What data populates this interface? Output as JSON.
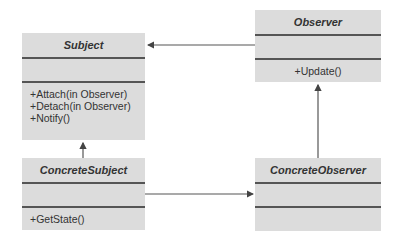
{
  "diagram": {
    "type": "UML class diagram (Observer pattern)",
    "classes": [
      {
        "id": "subject",
        "name": "Subject",
        "attributes": [],
        "operations": [
          "+Attach(in Observer)",
          "+Detach(in Observer)",
          "+Notify()"
        ]
      },
      {
        "id": "observer",
        "name": "Observer",
        "attributes": [],
        "operations": [
          "+Update()"
        ]
      },
      {
        "id": "concrete_subject",
        "name": "ConcreteSubject",
        "attributes": [],
        "operations": [
          "+GetState()"
        ]
      },
      {
        "id": "concrete_observer",
        "name": "ConcreteObserver",
        "attributes": [],
        "operations": []
      }
    ],
    "relations": [
      {
        "from": "Observer",
        "to": "Subject",
        "kind": "association arrow"
      },
      {
        "from": "ConcreteSubject",
        "to": "Subject",
        "kind": "arrow"
      },
      {
        "from": "ConcreteSubject",
        "to": "ConcreteObserver",
        "kind": "arrow"
      },
      {
        "from": "ConcreteObserver",
        "to": "Observer",
        "kind": "arrow"
      }
    ],
    "colors": {
      "box_fill": "#dcdcdc",
      "line": "#555555",
      "text": "#333333"
    }
  },
  "subject": {
    "name": "Subject",
    "op1": "+Attach(in Observer)",
    "op2": "+Detach(in Observer)",
    "op3": "+Notify()"
  },
  "observer": {
    "name": "Observer",
    "op1": "+Update()"
  },
  "concrete_subject": {
    "name": "ConcreteSubject",
    "op1": "+GetState()"
  },
  "concrete_observer": {
    "name": "ConcreteObserver"
  }
}
